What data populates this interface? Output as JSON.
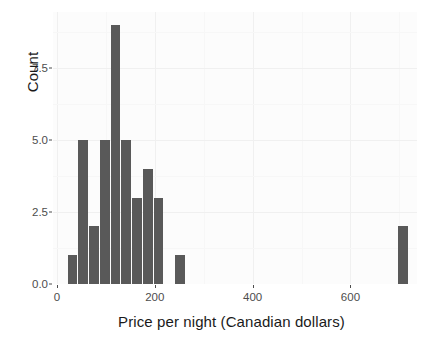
{
  "chart_data": {
    "type": "bar",
    "title": "",
    "subtitle": "",
    "xlabel": "Price per night (Canadian dollars)",
    "ylabel": "Count",
    "xlim": [
      -8,
      736
    ],
    "ylim": [
      0,
      9.45
    ],
    "xticks": [
      0,
      200,
      400,
      600
    ],
    "xtick_labels": [
      "0",
      "200",
      "400",
      "600"
    ],
    "yticks": [
      0.0,
      2.5,
      5.0,
      7.5
    ],
    "ytick_labels": [
      "0.0",
      "2.5",
      "5.0",
      "7.5"
    ],
    "grid": true,
    "legend": "none",
    "bin_width": 22,
    "bar_color": "#595959",
    "panel_color": "#fcfcfc",
    "grid_color": "#f0f0f0",
    "bins": [
      {
        "left": 22,
        "right": 44,
        "center": 33,
        "value": 1
      },
      {
        "left": 44,
        "right": 66,
        "center": 55,
        "value": 5
      },
      {
        "left": 66,
        "right": 88,
        "center": 77,
        "value": 2
      },
      {
        "left": 88,
        "right": 110,
        "center": 99,
        "value": 5
      },
      {
        "left": 110,
        "right": 132,
        "center": 121,
        "value": 9
      },
      {
        "left": 132,
        "right": 154,
        "center": 143,
        "value": 5
      },
      {
        "left": 154,
        "right": 176,
        "center": 165,
        "value": 3
      },
      {
        "left": 176,
        "right": 198,
        "center": 187,
        "value": 4
      },
      {
        "left": 198,
        "right": 220,
        "center": 209,
        "value": 3
      },
      {
        "left": 242,
        "right": 264,
        "center": 253,
        "value": 1
      },
      {
        "left": 698,
        "right": 720,
        "center": 709,
        "value": 2
      }
    ],
    "categories": [
      "33",
      "55",
      "77",
      "99",
      "121",
      "143",
      "165",
      "187",
      "209",
      "253",
      "709"
    ],
    "values": [
      1,
      5,
      2,
      5,
      9,
      5,
      3,
      4,
      3,
      1,
      2
    ]
  }
}
